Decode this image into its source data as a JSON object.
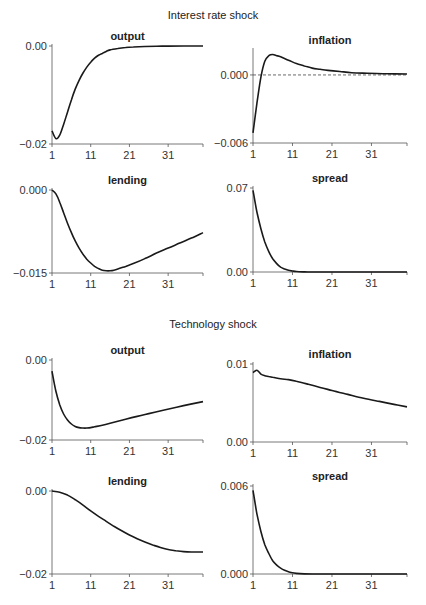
{
  "sections": [
    {
      "title": "Interest rate shock"
    },
    {
      "title": "Technology shock"
    }
  ],
  "chart_data": [
    {
      "type": "line",
      "section": "Interest rate shock",
      "title": "output",
      "x": [
        1,
        2,
        3,
        4,
        5,
        6,
        7,
        8,
        9,
        10,
        11,
        12,
        13,
        14,
        15,
        16,
        18,
        20,
        22,
        25,
        28,
        31,
        35,
        40
      ],
      "values": [
        -0.0173,
        -0.0189,
        -0.0182,
        -0.016,
        -0.0135,
        -0.011,
        -0.0088,
        -0.007,
        -0.0055,
        -0.0043,
        -0.0033,
        -0.0025,
        -0.0019,
        -0.0015,
        -0.0011,
        -0.0008,
        -0.0005,
        -0.0003,
        -0.0002,
        -0.0001,
        -5e-05,
        -2e-05,
        0,
        0
      ],
      "yticks": [
        "0.00",
        "-0.02"
      ],
      "ylim": [
        -0.02,
        0.0
      ],
      "xticks": [
        "1",
        "11",
        "21",
        "31"
      ],
      "xlim": [
        1,
        40
      ]
    },
    {
      "type": "line",
      "section": "Interest rate shock",
      "title": "inflation",
      "x": [
        1,
        2,
        3,
        4,
        5,
        6,
        7,
        8,
        10,
        12,
        14,
        16,
        18,
        20,
        23,
        26,
        30,
        35,
        40
      ],
      "values": [
        -0.0051,
        -0.0025,
        -0.0002,
        0.0012,
        0.0017,
        0.0018,
        0.0017,
        0.0016,
        0.0013,
        0.001,
        0.0008,
        0.0006,
        0.0005,
        0.0004,
        0.0003,
        0.0002,
        0.00015,
        0.0001,
        8e-05
      ],
      "yticks": [
        "0.000",
        "-0.006"
      ],
      "ylim": [
        -0.006,
        0.0022
      ],
      "zero_line": "dashed",
      "xticks": [
        "1",
        "11",
        "21",
        "31"
      ],
      "xlim": [
        1,
        40
      ]
    },
    {
      "type": "line",
      "section": "Interest rate shock",
      "title": "lending",
      "x": [
        1,
        2,
        3,
        4,
        5,
        6,
        7,
        8,
        9,
        10,
        11,
        12,
        13,
        14,
        15,
        16,
        17,
        18,
        20,
        22,
        25,
        28,
        31,
        34,
        37,
        40
      ],
      "values": [
        0,
        -0.0007,
        -0.0022,
        -0.0041,
        -0.006,
        -0.0077,
        -0.0092,
        -0.0105,
        -0.0116,
        -0.0125,
        -0.0132,
        -0.0138,
        -0.0142,
        -0.0145,
        -0.0146,
        -0.0146,
        -0.0145,
        -0.0143,
        -0.0138,
        -0.0133,
        -0.0124,
        -0.0114,
        -0.0105,
        -0.0096,
        -0.0087,
        -0.0077
      ],
      "yticks": [
        "0.000",
        "-0.015"
      ],
      "ylim": [
        -0.015,
        0.0
      ],
      "xticks": [
        "1",
        "11",
        "21",
        "31"
      ],
      "xlim": [
        1,
        40
      ]
    },
    {
      "type": "line",
      "section": "Interest rate shock",
      "title": "spread",
      "x": [
        1,
        2,
        3,
        4,
        5,
        6,
        7,
        8,
        9,
        10,
        11,
        12,
        14,
        16,
        20,
        30,
        40
      ],
      "values": [
        0.068,
        0.05,
        0.036,
        0.025,
        0.017,
        0.011,
        0.007,
        0.004,
        0.0025,
        0.0014,
        0.0008,
        0.0004,
        0.0001,
        3e-05,
        0,
        0,
        0
      ],
      "yticks": [
        "0.07",
        "0.00"
      ],
      "ylim": [
        0.0,
        0.07
      ],
      "xticks": [
        "1",
        "11",
        "21",
        "31"
      ],
      "xlim": [
        1,
        40
      ]
    },
    {
      "type": "line",
      "section": "Technology shock",
      "title": "output",
      "x": [
        1,
        2,
        3,
        4,
        5,
        6,
        7,
        8,
        9,
        10,
        11,
        12,
        14,
        16,
        18,
        20,
        23,
        26,
        30,
        35,
        40
      ],
      "values": [
        -0.0028,
        -0.0078,
        -0.0112,
        -0.0135,
        -0.015,
        -0.016,
        -0.0166,
        -0.0169,
        -0.017,
        -0.017,
        -0.0169,
        -0.0167,
        -0.0163,
        -0.0158,
        -0.0153,
        -0.0148,
        -0.0141,
        -0.0134,
        -0.0125,
        -0.0114,
        -0.0104
      ],
      "yticks": [
        "0.00",
        "-0.02"
      ],
      "ylim": [
        -0.02,
        0.0
      ],
      "xticks": [
        "1",
        "11",
        "21",
        "31"
      ],
      "xlim": [
        1,
        40
      ]
    },
    {
      "type": "line",
      "section": "Technology shock",
      "title": "inflation",
      "x": [
        1,
        2,
        3,
        4,
        5,
        6,
        8,
        10,
        12,
        15,
        18,
        21,
        25,
        29,
        33,
        37,
        40
      ],
      "values": [
        0.0089,
        0.0092,
        0.0087,
        0.0085,
        0.0084,
        0.0083,
        0.0081,
        0.008,
        0.0078,
        0.0074,
        0.007,
        0.0066,
        0.0061,
        0.0056,
        0.0052,
        0.0048,
        0.0045
      ],
      "yticks": [
        "0.01",
        "0.00"
      ],
      "ylim": [
        0.0,
        0.01
      ],
      "xticks": [
        "1",
        "11",
        "21",
        "31"
      ],
      "xlim": [
        1,
        40
      ]
    },
    {
      "type": "line",
      "section": "Technology shock",
      "title": "lending",
      "x": [
        1,
        3,
        5,
        7,
        9,
        11,
        13,
        15,
        17,
        19,
        21,
        23,
        25,
        27,
        29,
        31,
        33,
        35,
        37,
        40
      ],
      "values": [
        0,
        -0.0003,
        -0.001,
        -0.0021,
        -0.0034,
        -0.0048,
        -0.0061,
        -0.0073,
        -0.0085,
        -0.0096,
        -0.0106,
        -0.0115,
        -0.0123,
        -0.013,
        -0.0136,
        -0.0141,
        -0.0144,
        -0.0146,
        -0.0147,
        -0.0147
      ],
      "yticks": [
        "0.00",
        "-0.02"
      ],
      "ylim": [
        -0.02,
        0.0
      ],
      "xticks": [
        "1",
        "11",
        "21",
        "31"
      ],
      "xlim": [
        1,
        40
      ]
    },
    {
      "type": "line",
      "section": "Technology shock",
      "title": "spread",
      "x": [
        1,
        2,
        3,
        4,
        5,
        6,
        7,
        8,
        9,
        10,
        11,
        12,
        14,
        16,
        20,
        30,
        40
      ],
      "values": [
        0.0057,
        0.0041,
        0.0029,
        0.002,
        0.0014,
        0.0009,
        0.0006,
        0.0004,
        0.00025,
        0.00015,
        8e-05,
        4e-05,
        1e-05,
        0,
        0,
        0,
        0
      ],
      "yticks": [
        "0.006",
        "0.000"
      ],
      "ylim": [
        0.0,
        0.006
      ],
      "xticks": [
        "1",
        "11",
        "21",
        "31"
      ],
      "xlim": [
        1,
        40
      ]
    }
  ]
}
